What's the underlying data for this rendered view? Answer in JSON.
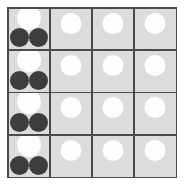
{
  "figure": {
    "width": 184,
    "height": 186,
    "background_color": "#ffffff"
  },
  "board": {
    "rows": 4,
    "columns": 4,
    "cell_background_color": "#dcdcdc",
    "grid_line_color": "#4a4a4a",
    "grid_line_width": 1.5,
    "left": 7,
    "top": 7,
    "width": 170,
    "height": 171
  },
  "tokens": {
    "white_color": "#fdfdfd",
    "dark_color": "#3d3d3d",
    "white_large_label": "white-token-large",
    "white_small_label": "white-token-small",
    "dark_label": "dark-token"
  },
  "cells": [
    {
      "row": 1,
      "column": 1,
      "token_count": 3,
      "tokens": [
        {
          "color": "white",
          "size": "large",
          "position": "top-center"
        },
        {
          "color": "dark",
          "size": "small",
          "position": "bottom-left"
        },
        {
          "color": "dark",
          "size": "small",
          "position": "bottom-right"
        }
      ]
    },
    {
      "row": 1,
      "column": 2,
      "token_count": 1,
      "tokens": [
        {
          "color": "white",
          "size": "small",
          "position": "upper-center"
        }
      ]
    },
    {
      "row": 1,
      "column": 3,
      "token_count": 1,
      "tokens": [
        {
          "color": "white",
          "size": "small",
          "position": "upper-center"
        }
      ]
    },
    {
      "row": 1,
      "column": 4,
      "token_count": 1,
      "tokens": [
        {
          "color": "white",
          "size": "small",
          "position": "upper-center"
        }
      ]
    },
    {
      "row": 2,
      "column": 1,
      "token_count": 3,
      "tokens": [
        {
          "color": "white",
          "size": "large",
          "position": "top-center"
        },
        {
          "color": "dark",
          "size": "small",
          "position": "bottom-left"
        },
        {
          "color": "dark",
          "size": "small",
          "position": "bottom-right"
        }
      ]
    },
    {
      "row": 2,
      "column": 2,
      "token_count": 1,
      "tokens": [
        {
          "color": "white",
          "size": "small",
          "position": "upper-center"
        }
      ]
    },
    {
      "row": 2,
      "column": 3,
      "token_count": 1,
      "tokens": [
        {
          "color": "white",
          "size": "small",
          "position": "upper-center"
        }
      ]
    },
    {
      "row": 2,
      "column": 4,
      "token_count": 1,
      "tokens": [
        {
          "color": "white",
          "size": "small",
          "position": "upper-center"
        }
      ]
    },
    {
      "row": 3,
      "column": 1,
      "token_count": 3,
      "tokens": [
        {
          "color": "white",
          "size": "large",
          "position": "top-center"
        },
        {
          "color": "dark",
          "size": "small",
          "position": "bottom-left"
        },
        {
          "color": "dark",
          "size": "small",
          "position": "bottom-right"
        }
      ]
    },
    {
      "row": 3,
      "column": 2,
      "token_count": 1,
      "tokens": [
        {
          "color": "white",
          "size": "small",
          "position": "upper-center"
        }
      ]
    },
    {
      "row": 3,
      "column": 3,
      "token_count": 1,
      "tokens": [
        {
          "color": "white",
          "size": "small",
          "position": "upper-center"
        }
      ]
    },
    {
      "row": 3,
      "column": 4,
      "token_count": 1,
      "tokens": [
        {
          "color": "white",
          "size": "small",
          "position": "upper-center"
        }
      ]
    },
    {
      "row": 4,
      "column": 1,
      "token_count": 3,
      "tokens": [
        {
          "color": "white",
          "size": "large",
          "position": "top-center"
        },
        {
          "color": "dark",
          "size": "small",
          "position": "bottom-left"
        },
        {
          "color": "dark",
          "size": "small",
          "position": "bottom-right"
        }
      ]
    },
    {
      "row": 4,
      "column": 2,
      "token_count": 1,
      "tokens": [
        {
          "color": "white",
          "size": "small",
          "position": "upper-center"
        }
      ]
    },
    {
      "row": 4,
      "column": 3,
      "token_count": 1,
      "tokens": [
        {
          "color": "white",
          "size": "small",
          "position": "upper-center"
        }
      ]
    },
    {
      "row": 4,
      "column": 4,
      "token_count": 1,
      "tokens": [
        {
          "color": "white",
          "size": "small",
          "position": "upper-center"
        }
      ]
    }
  ]
}
